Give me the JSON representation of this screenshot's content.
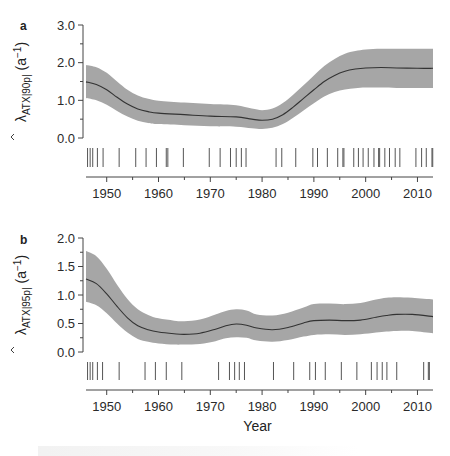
{
  "chart_data": [
    {
      "panel": "a",
      "type": "line",
      "title": "",
      "xlabel": "",
      "ylabel": "λ̂ ATX|90p| (a⁻¹)",
      "ylabel_parts": {
        "symbol": "λ",
        "hat": "^",
        "subscript": "ATX|90p|",
        "unit": "(a",
        "unit_sup": "−1",
        "unit_close": ")"
      },
      "ylim": [
        0,
        3.0
      ],
      "yticks": [
        0.0,
        1.0,
        2.0,
        3.0
      ],
      "ytick_labels": [
        "0.0",
        "1.0",
        "2.0",
        "3.0"
      ],
      "xlim": [
        1946,
        2013
      ],
      "xticks": [
        1950,
        1960,
        1970,
        1980,
        1990,
        2000,
        2010
      ],
      "xtick_labels": [
        "1950",
        "1960",
        "1970",
        "1980",
        "1990",
        "2000",
        "2010"
      ],
      "grid": false,
      "legend": null,
      "series": [
        {
          "name": "estimate",
          "x": [
            1946,
            1948,
            1950,
            1952,
            1954,
            1956,
            1958,
            1960,
            1965,
            1970,
            1975,
            1978,
            1980,
            1982,
            1984,
            1986,
            1988,
            1990,
            1992,
            1994,
            1996,
            1998,
            2000,
            2003,
            2006,
            2010,
            2013
          ],
          "y": [
            1.49,
            1.42,
            1.28,
            1.08,
            0.9,
            0.77,
            0.7,
            0.66,
            0.62,
            0.58,
            0.56,
            0.5,
            0.47,
            0.5,
            0.62,
            0.82,
            1.05,
            1.28,
            1.5,
            1.66,
            1.77,
            1.83,
            1.86,
            1.87,
            1.86,
            1.85,
            1.85
          ],
          "lower": [
            1.06,
            1.0,
            0.88,
            0.72,
            0.57,
            0.46,
            0.4,
            0.37,
            0.34,
            0.31,
            0.3,
            0.26,
            0.24,
            0.27,
            0.37,
            0.54,
            0.73,
            0.92,
            1.1,
            1.22,
            1.29,
            1.32,
            1.34,
            1.34,
            1.33,
            1.33,
            1.33
          ],
          "upper": [
            1.94,
            1.88,
            1.73,
            1.5,
            1.28,
            1.13,
            1.04,
            0.99,
            0.94,
            0.9,
            0.87,
            0.78,
            0.74,
            0.78,
            0.93,
            1.15,
            1.4,
            1.66,
            1.91,
            2.1,
            2.24,
            2.31,
            2.35,
            2.37,
            2.37,
            2.37,
            2.37
          ]
        }
      ],
      "rug_events": [
        1946.3,
        1946.8,
        1947.3,
        1948.2,
        1949.3,
        1952.4,
        1955.6,
        1957.6,
        1959.6,
        1961.5,
        1961.8,
        1964.8,
        1969.8,
        1971.9,
        1973.9,
        1975.0,
        1976.0,
        1976.9,
        1982.7,
        1983.8,
        1986.5,
        1989.8,
        1990.7,
        1992.6,
        1994.6,
        1995.6,
        1995.8,
        1997.7,
        1998.6,
        1999.5,
        2000.5,
        2001.6,
        2002.5,
        2002.7,
        2003.7,
        2004.6,
        2005.7,
        2006.6,
        2009.7,
        2010.8,
        2011.7,
        2012.8,
        2012.95
      ]
    },
    {
      "panel": "b",
      "type": "line",
      "title": "",
      "xlabel": "Year",
      "ylabel": "λ̂ ATX|95p| (a⁻¹)",
      "ylabel_parts": {
        "symbol": "λ",
        "hat": "^",
        "subscript": "ATX|95p|",
        "unit": "(a",
        "unit_sup": "−1",
        "unit_close": ")"
      },
      "ylim": [
        0,
        2.0
      ],
      "yticks": [
        0.0,
        0.5,
        1.0,
        1.5,
        2.0
      ],
      "ytick_labels": [
        "0.0",
        "0.5",
        "1.0",
        "1.5",
        "2.0"
      ],
      "xlim": [
        1946,
        2013
      ],
      "xticks": [
        1950,
        1960,
        1970,
        1980,
        1990,
        2000,
        2010
      ],
      "xtick_labels": [
        "1950",
        "1960",
        "1970",
        "1980",
        "1990",
        "2000",
        "2010"
      ],
      "grid": false,
      "legend": null,
      "series": [
        {
          "name": "estimate",
          "x": [
            1946,
            1948,
            1950,
            1952,
            1954,
            1956,
            1958,
            1960,
            1963,
            1965,
            1968,
            1971,
            1973,
            1975,
            1977,
            1979,
            1982,
            1985,
            1988,
            1990,
            1993,
            1996,
            1999,
            2002,
            2004,
            2006,
            2009,
            2013
          ],
          "y": [
            1.28,
            1.2,
            1.02,
            0.8,
            0.6,
            0.46,
            0.39,
            0.35,
            0.32,
            0.31,
            0.33,
            0.4,
            0.46,
            0.49,
            0.47,
            0.42,
            0.39,
            0.43,
            0.51,
            0.55,
            0.56,
            0.55,
            0.56,
            0.61,
            0.64,
            0.66,
            0.66,
            0.62
          ],
          "lower": [
            0.88,
            0.82,
            0.68,
            0.5,
            0.34,
            0.23,
            0.18,
            0.15,
            0.13,
            0.13,
            0.14,
            0.19,
            0.24,
            0.26,
            0.25,
            0.2,
            0.18,
            0.21,
            0.27,
            0.3,
            0.31,
            0.3,
            0.31,
            0.34,
            0.36,
            0.37,
            0.37,
            0.33
          ],
          "upper": [
            1.77,
            1.68,
            1.46,
            1.18,
            0.93,
            0.75,
            0.65,
            0.59,
            0.55,
            0.54,
            0.57,
            0.66,
            0.72,
            0.75,
            0.73,
            0.66,
            0.64,
            0.69,
            0.78,
            0.84,
            0.85,
            0.84,
            0.86,
            0.92,
            0.95,
            0.96,
            0.95,
            0.92
          ]
        }
      ],
      "rug_events": [
        1946.3,
        1946.8,
        1947.3,
        1948.2,
        1949.2,
        1952.4,
        1957.4,
        1959.4,
        1961.5,
        1964.5,
        1971.6,
        1973.7,
        1974.7,
        1975.6,
        1976.6,
        1982.2,
        1986.1,
        1989.2,
        1990.3,
        1992.2,
        1995.3,
        1998.3,
        2001.1,
        2002.2,
        2003.2,
        2004.1,
        2006.0,
        2011.2,
        2012.1,
        2012.3
      ]
    }
  ],
  "colors": {
    "band": "#a6a6a6",
    "line": "#333333",
    "axis": "#444444",
    "rug": "#555555",
    "text": "#2a2a2a"
  },
  "labels": {
    "panel_a": "a",
    "panel_b": "b",
    "year": "Year"
  }
}
